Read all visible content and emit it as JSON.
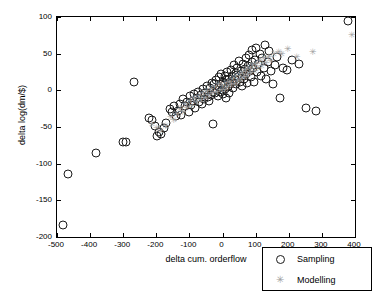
{
  "chart_data": {
    "type": "scatter",
    "title": "",
    "xlabel": "delta cum. orderflow",
    "ylabel": "delta log(dm/$)",
    "xlim": [
      -500,
      400
    ],
    "ylim": [
      -200,
      100
    ],
    "xticks": [
      -500,
      -400,
      -300,
      -200,
      -100,
      0,
      100,
      200,
      300,
      400
    ],
    "xticklabels": [
      "-500",
      "-400",
      "-300",
      "-200",
      "-100",
      "0",
      "100",
      "200",
      "300",
      "400"
    ],
    "yticks": [
      -200,
      -150,
      -100,
      -50,
      0,
      50,
      100
    ],
    "yticklabels": [
      "-200",
      "-150",
      "-100",
      "-50",
      "0",
      "50",
      "100"
    ],
    "grid": false,
    "legend": {
      "position": "lower right",
      "entries": [
        {
          "name": "Sampling",
          "marker": "open-circle",
          "color": "#1a1a1a"
        },
        {
          "name": "Modelling",
          "marker": "star",
          "color": "#a0a0a0"
        }
      ]
    },
    "series": [
      {
        "name": "Sampling",
        "marker": "open-circle",
        "color": "#1a1a1a",
        "points": [
          [
            -482,
            -183
          ],
          [
            -468,
            -114
          ],
          [
            -382,
            -85
          ],
          [
            -302,
            -71
          ],
          [
            -292,
            -70
          ],
          [
            -268,
            12
          ],
          [
            -222,
            -38
          ],
          [
            -212,
            -41
          ],
          [
            -205,
            -49
          ],
          [
            -198,
            -62
          ],
          [
            -192,
            -57
          ],
          [
            -186,
            -60
          ],
          [
            -176,
            -52
          ],
          [
            -170,
            -44
          ],
          [
            -160,
            -25
          ],
          [
            -152,
            -30
          ],
          [
            -146,
            -22
          ],
          [
            -140,
            -35
          ],
          [
            -134,
            -28
          ],
          [
            -128,
            -18
          ],
          [
            -124,
            -33
          ],
          [
            -118,
            -12
          ],
          [
            -112,
            -22
          ],
          [
            -106,
            -16
          ],
          [
            -102,
            -30
          ],
          [
            -98,
            -8
          ],
          [
            -95,
            -20
          ],
          [
            -90,
            -14
          ],
          [
            -86,
            -5
          ],
          [
            -82,
            -24
          ],
          [
            -78,
            -10
          ],
          [
            -74,
            -2
          ],
          [
            -70,
            -16
          ],
          [
            -66,
            -6
          ],
          [
            -62,
            -19
          ],
          [
            -58,
            2
          ],
          [
            -55,
            -12
          ],
          [
            -52,
            -4
          ],
          [
            -48,
            6
          ],
          [
            -45,
            -9
          ],
          [
            -42,
            -14
          ],
          [
            -38,
            3
          ],
          [
            -35,
            -6
          ],
          [
            -32,
            10
          ],
          [
            -30,
            -46
          ],
          [
            -28,
            -2
          ],
          [
            -25,
            8
          ],
          [
            -22,
            -4
          ],
          [
            -20,
            14
          ],
          [
            -18,
            1
          ],
          [
            -15,
            -8
          ],
          [
            -12,
            5
          ],
          [
            -10,
            18
          ],
          [
            -8,
            -2
          ],
          [
            -6,
            9
          ],
          [
            -4,
            22
          ],
          [
            -2,
            0
          ],
          [
            0,
            12
          ],
          [
            2,
            -5
          ],
          [
            4,
            7
          ],
          [
            6,
            19
          ],
          [
            8,
            2
          ],
          [
            10,
            -10
          ],
          [
            12,
            14
          ],
          [
            14,
            25
          ],
          [
            16,
            5
          ],
          [
            18,
            -3
          ],
          [
            20,
            16
          ],
          [
            22,
            9
          ],
          [
            25,
            28
          ],
          [
            28,
            12
          ],
          [
            30,
            20
          ],
          [
            32,
            3
          ],
          [
            35,
            34
          ],
          [
            38,
            15
          ],
          [
            40,
            24
          ],
          [
            42,
            8
          ],
          [
            45,
            30
          ],
          [
            48,
            18
          ],
          [
            50,
            40
          ],
          [
            52,
            11
          ],
          [
            55,
            26
          ],
          [
            58,
            6
          ],
          [
            60,
            20
          ],
          [
            62,
            36
          ],
          [
            65,
            15
          ],
          [
            68,
            29
          ],
          [
            70,
            44
          ],
          [
            72,
            22
          ],
          [
            75,
            10
          ],
          [
            78,
            33
          ],
          [
            80,
            48
          ],
          [
            82,
            26
          ],
          [
            85,
            18
          ],
          [
            88,
            38
          ],
          [
            90,
            55
          ],
          [
            92,
            30
          ],
          [
            95,
            12
          ],
          [
            98,
            42
          ],
          [
            100,
            58
          ],
          [
            104,
            25
          ],
          [
            108,
            36
          ],
          [
            112,
            50
          ],
          [
            116,
            20
          ],
          [
            120,
            44
          ],
          [
            124,
            30
          ],
          [
            128,
            62
          ],
          [
            132,
            16
          ],
          [
            136,
            38
          ],
          [
            140,
            54
          ],
          [
            146,
            26
          ],
          [
            152,
            8
          ],
          [
            158,
            34
          ],
          [
            165,
            46
          ],
          [
            172,
            -10
          ],
          [
            182,
            30
          ],
          [
            196,
            28
          ],
          [
            210,
            42
          ],
          [
            232,
            36
          ],
          [
            252,
            -24
          ],
          [
            282,
            -28
          ],
          [
            378,
            94
          ]
        ]
      },
      {
        "name": "Modelling",
        "marker": "star",
        "color": "#a0a0a0",
        "points": [
          [
            -215,
            -46
          ],
          [
            -200,
            -52
          ],
          [
            -188,
            -55
          ],
          [
            -172,
            -48
          ],
          [
            -158,
            -37
          ],
          [
            -148,
            -41
          ],
          [
            -138,
            -32
          ],
          [
            -130,
            -26
          ],
          [
            -122,
            -30
          ],
          [
            -115,
            -18
          ],
          [
            -108,
            -24
          ],
          [
            -100,
            -14
          ],
          [
            -94,
            -21
          ],
          [
            -88,
            -10
          ],
          [
            -80,
            -16
          ],
          [
            -74,
            -8
          ],
          [
            -68,
            -13
          ],
          [
            -60,
            -4
          ],
          [
            -54,
            -10
          ],
          [
            -48,
            -1
          ],
          [
            -42,
            -7
          ],
          [
            -36,
            2
          ],
          [
            -30,
            -4
          ],
          [
            -24,
            5
          ],
          [
            -18,
            -2
          ],
          [
            -12,
            8
          ],
          [
            -6,
            1
          ],
          [
            0,
            6
          ],
          [
            5,
            0
          ],
          [
            10,
            10
          ],
          [
            15,
            4
          ],
          [
            20,
            12
          ],
          [
            25,
            7
          ],
          [
            30,
            16
          ],
          [
            35,
            9
          ],
          [
            40,
            20
          ],
          [
            45,
            13
          ],
          [
            50,
            22
          ],
          [
            55,
            16
          ],
          [
            60,
            25
          ],
          [
            65,
            18
          ],
          [
            70,
            28
          ],
          [
            75,
            21
          ],
          [
            80,
            30
          ],
          [
            85,
            24
          ],
          [
            90,
            34
          ],
          [
            95,
            27
          ],
          [
            100,
            36
          ],
          [
            106,
            30
          ],
          [
            112,
            40
          ],
          [
            118,
            33
          ],
          [
            124,
            44
          ],
          [
            130,
            37
          ],
          [
            138,
            46
          ],
          [
            146,
            40
          ],
          [
            155,
            50
          ],
          [
            168,
            52
          ],
          [
            178,
            50
          ],
          [
            196,
            56
          ],
          [
            222,
            45
          ],
          [
            272,
            52
          ],
          [
            388,
            76
          ]
        ]
      }
    ]
  }
}
